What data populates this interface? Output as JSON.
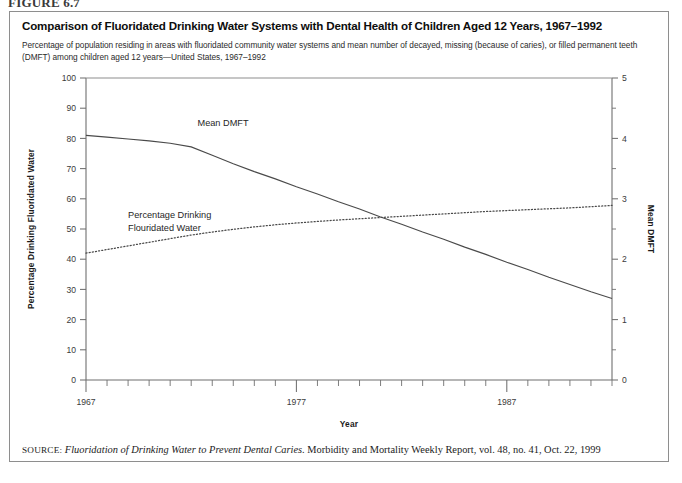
{
  "figure": {
    "number_label": "FIGURE 6.7",
    "title": "Comparison of Fluoridated Drinking Water Systems with Dental Health of Children Aged 12 Years, 1967–1992",
    "subtitle": "Percentage of population residing in areas with fluoridated community water systems and mean number of decayed, missing (because of caries), or filled permanent teeth (DMFT) among children aged 12 years—United States, 1967–1992",
    "source_key": "SOURCE:",
    "source_title": "Fluoridation of Drinking Water to Prevent Dental Caries.",
    "source_rest": " Morbidity and Mortality Weekly Report, vol. 48, no. 41, Oct. 22, 1999"
  },
  "chart_data": {
    "type": "line",
    "title": "Comparison of Fluoridated Drinking Water Systems with Dental Health of Children Aged 12 Years, 1967–1992",
    "xlabel": "Year",
    "ylabel": "Percentage Drinking Fluoridated Water",
    "y2label": "Mean DMFT",
    "xlim": [
      1967,
      1992
    ],
    "ylim": [
      0,
      100
    ],
    "y2lim": [
      0,
      5
    ],
    "grid": false,
    "legend": "inline-annotations",
    "xticks": [
      1967,
      1968,
      1969,
      1970,
      1971,
      1972,
      1973,
      1974,
      1975,
      1976,
      1977,
      1978,
      1979,
      1980,
      1981,
      1982,
      1983,
      1984,
      1985,
      1986,
      1987,
      1988,
      1989,
      1990,
      1991,
      1992
    ],
    "xtick_labels": [
      "1967",
      "",
      "",
      "",
      "",
      "",
      "",
      "",
      "",
      "",
      "1977",
      "",
      "",
      "",
      "",
      "",
      "",
      "",
      "",
      "",
      "1987",
      "",
      "",
      "",
      "",
      ""
    ],
    "ytick_labels": [
      "0",
      "10",
      "20",
      "30",
      "40",
      "50",
      "60",
      "70",
      "80",
      "90",
      "100"
    ],
    "yticks": [
      0,
      10,
      20,
      30,
      40,
      50,
      60,
      70,
      80,
      90,
      100
    ],
    "y2tick_labels": [
      "0",
      "1",
      "2",
      "3",
      "4",
      "5"
    ],
    "y2ticks": [
      0,
      1,
      2,
      3,
      4,
      5
    ],
    "y2_minor_ticks": [
      0.5,
      1.5,
      2.5,
      3.5,
      4.5
    ],
    "series": [
      {
        "name": "Mean DMFT",
        "label": "Mean DMFT",
        "axis": "right",
        "style": "solid",
        "color": "#4a4a4a",
        "x": [
          1967,
          1968,
          1969,
          1970,
          1971,
          1972,
          1973,
          1974,
          1975,
          1976,
          1977,
          1978,
          1979,
          1980,
          1981,
          1982,
          1983,
          1984,
          1985,
          1986,
          1987,
          1988,
          1989,
          1990,
          1991,
          1992
        ],
        "values": [
          4.05,
          4.02,
          3.99,
          3.96,
          3.92,
          3.86,
          3.72,
          3.58,
          3.45,
          3.33,
          3.2,
          3.08,
          2.95,
          2.83,
          2.7,
          2.58,
          2.45,
          2.33,
          2.2,
          2.08,
          1.95,
          1.83,
          1.7,
          1.58,
          1.46,
          1.35
        ]
      },
      {
        "name": "Percentage Drinking Fluoridated Water",
        "label": "Percentage Drinking\nFlouridated Water",
        "label_line1": "Percentage Drinking",
        "label_line2": "Flouridated Water",
        "axis": "left",
        "style": "dotted",
        "color": "#4a4a4a",
        "x": [
          1967,
          1968,
          1969,
          1970,
          1971,
          1972,
          1973,
          1974,
          1975,
          1976,
          1977,
          1978,
          1979,
          1980,
          1981,
          1982,
          1983,
          1984,
          1985,
          1986,
          1987,
          1988,
          1989,
          1990,
          1991,
          1992
        ],
        "values": [
          42,
          43.2,
          44.4,
          45.6,
          46.8,
          48,
          49,
          49.9,
          50.7,
          51.4,
          52,
          52.5,
          53,
          53.4,
          53.8,
          54.2,
          54.6,
          55,
          55.4,
          55.8,
          56.1,
          56.4,
          56.7,
          57,
          57.4,
          57.8
        ]
      }
    ],
    "annotations": [
      {
        "text": "Mean DMFT",
        "x": 1972.3,
        "y_axis": "right",
        "y": 4.2
      },
      {
        "text": "Percentage Drinking",
        "x": 1969.0,
        "y_axis": "left",
        "y": 53.5
      },
      {
        "text": "Flouridated Water",
        "x": 1969.0,
        "y_axis": "left",
        "y": 49.5
      }
    ]
  }
}
